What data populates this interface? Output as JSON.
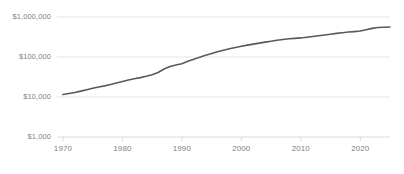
{
  "chart_data": {
    "type": "line",
    "title": "",
    "subtitle": "",
    "xlabel": "",
    "ylabel": "",
    "yscale": "log",
    "ylim": [
      1000,
      1000000
    ],
    "xlim": [
      1969,
      2025
    ],
    "grid": "horizontal",
    "legend": "none",
    "y_ticks": [
      {
        "value": 1000000,
        "label": "$1,000,000"
      },
      {
        "value": 100000,
        "label": "$100,000"
      },
      {
        "value": 10000,
        "label": "$10,000"
      },
      {
        "value": 1000,
        "label": "$1,000"
      }
    ],
    "x_ticks": [
      {
        "value": 1970,
        "label": "1970"
      },
      {
        "value": 1980,
        "label": "1980"
      },
      {
        "value": 1990,
        "label": "1990"
      },
      {
        "value": 2000,
        "label": "2000"
      },
      {
        "value": 2010,
        "label": "2010"
      },
      {
        "value": 2020,
        "label": "2020"
      }
    ],
    "series": [
      {
        "name": "value",
        "color": "#595959",
        "x": [
          1970,
          1971,
          1972,
          1973,
          1974,
          1975,
          1976,
          1977,
          1978,
          1979,
          1980,
          1981,
          1982,
          1983,
          1984,
          1985,
          1986,
          1987,
          1988,
          1989,
          1990,
          1991,
          1992,
          1993,
          1994,
          1995,
          1996,
          1997,
          1998,
          1999,
          2000,
          2001,
          2002,
          2003,
          2004,
          2005,
          2006,
          2007,
          2008,
          2009,
          2010,
          2011,
          2012,
          2013,
          2014,
          2015,
          2016,
          2017,
          2018,
          2019,
          2020,
          2021,
          2022,
          2023,
          2024,
          2025
        ],
        "values": [
          11500,
          12200,
          13000,
          14000,
          15200,
          16500,
          17800,
          19000,
          20500,
          22500,
          24500,
          26500,
          28500,
          30500,
          33000,
          36000,
          41000,
          50000,
          58000,
          63000,
          68000,
          78000,
          88000,
          98000,
          110000,
          122000,
          135000,
          148000,
          160000,
          172000,
          185000,
          198000,
          210000,
          222000,
          235000,
          248000,
          262000,
          275000,
          285000,
          292000,
          300000,
          312000,
          325000,
          340000,
          355000,
          372000,
          390000,
          405000,
          420000,
          432000,
          445000,
          480000,
          520000,
          545000,
          555000,
          560000
        ]
      }
    ]
  },
  "colors": {
    "line": "#595959",
    "grid": "#e6e6e6",
    "axis": "#d9d9d9",
    "tick_text": "#808080",
    "background": "#ffffff"
  }
}
